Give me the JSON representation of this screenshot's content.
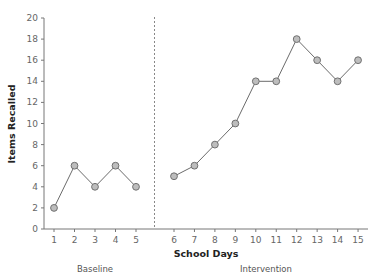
{
  "chart_data": {
    "type": "line",
    "title": "",
    "xlabel": "School Days",
    "ylabel": "Items Recalled",
    "ylim": [
      0,
      20
    ],
    "yticks": [
      0,
      2,
      4,
      6,
      8,
      10,
      12,
      14,
      16,
      18,
      20
    ],
    "xticks": [
      1,
      2,
      3,
      4,
      5,
      6,
      7,
      8,
      9,
      10,
      11,
      12,
      13,
      14,
      15
    ],
    "grid": false,
    "legend": null,
    "phase_divider": "dashed vertical line between day 5 and day 6",
    "phases": [
      {
        "name": "Baseline",
        "x": [
          1,
          2,
          3,
          4,
          5
        ],
        "values": [
          2,
          6,
          4,
          6,
          4
        ]
      },
      {
        "name": "Intervention",
        "x": [
          6,
          7,
          8,
          9,
          10,
          11,
          12,
          13,
          14,
          15
        ],
        "values": [
          5,
          6,
          8,
          10,
          14,
          14,
          18,
          16,
          14,
          16
        ]
      }
    ],
    "colors": {
      "line": "#6b6b6b",
      "marker_fill": "#bdbdbd",
      "marker_stroke": "#707070",
      "axis": "#777777",
      "divider": "#888888"
    }
  },
  "labels": {
    "y_axis_title": "Items Recalled",
    "x_axis_title": "School Days",
    "baseline": "Baseline",
    "intervention": "Intervention"
  }
}
